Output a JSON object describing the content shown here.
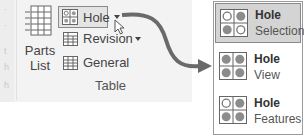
{
  "ribbon": {
    "group_label": "Table",
    "edge_chars": [
      "·",
      "·",
      "t",
      "h",
      "h"
    ],
    "parts_list": {
      "label_line1": "Parts",
      "label_line2": "List",
      "icon": "parts-list-icon"
    },
    "buttons": [
      {
        "label": "Hole",
        "icon": "hole-table-icon",
        "has_dropdown": true,
        "state": "hovered"
      },
      {
        "label": "Revision",
        "icon": "revision-table-icon",
        "has_dropdown": true
      },
      {
        "label": "General",
        "icon": "general-table-icon",
        "has_dropdown": false
      }
    ]
  },
  "dropdown_menu": {
    "items": [
      {
        "title": "Hole",
        "subtitle": "Selection",
        "icon": "hole-selection-icon",
        "selected": true
      },
      {
        "title": "Hole",
        "subtitle": "View",
        "icon": "hole-view-icon",
        "selected": false
      },
      {
        "title": "Hole",
        "subtitle": "Features",
        "icon": "hole-features-icon",
        "selected": false
      }
    ]
  },
  "colors": {
    "ribbon_bg": "#f3f3f3",
    "highlight_bg": "#d4d4d4",
    "border": "#8a8a8a",
    "arrow": "#666666",
    "icon_gray": "#8c8c8c"
  }
}
